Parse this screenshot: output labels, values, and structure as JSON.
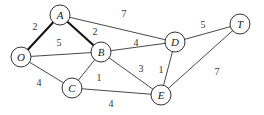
{
  "nodes": [
    {
      "id": "A",
      "label": "A",
      "x": 60,
      "y": 15
    },
    {
      "id": "O",
      "label": "O",
      "x": 21,
      "y": 57
    },
    {
      "id": "B",
      "label": "B",
      "x": 101,
      "y": 52
    },
    {
      "id": "C",
      "label": "C",
      "x": 72,
      "y": 88
    },
    {
      "id": "D",
      "label": "D",
      "x": 175,
      "y": 42
    },
    {
      "id": "T",
      "label": "T",
      "x": 240,
      "y": 24
    },
    {
      "id": "E",
      "label": "E",
      "x": 161,
      "y": 95
    }
  ],
  "edges": [
    {
      "from": "O",
      "to": "A",
      "weight": "2",
      "bold": true,
      "lx": 35,
      "ly": 26
    },
    {
      "from": "A",
      "to": "B",
      "weight": "2",
      "bold": true,
      "lx": 95,
      "ly": 31
    },
    {
      "from": "A",
      "to": "D",
      "weight": "7",
      "bold": false,
      "lx": 124,
      "ly": 13
    },
    {
      "from": "O",
      "to": "B",
      "weight": "5",
      "bold": false,
      "lx": 59,
      "ly": 42
    },
    {
      "from": "O",
      "to": "C",
      "weight": "4",
      "bold": false,
      "lx": 39,
      "ly": 82
    },
    {
      "from": "B",
      "to": "C",
      "weight": "1",
      "bold": false,
      "lx": 99,
      "ly": 77
    },
    {
      "from": "B",
      "to": "D",
      "weight": "4",
      "bold": false,
      "lx": 136,
      "ly": 42
    },
    {
      "from": "B",
      "to": "E",
      "weight": "3",
      "bold": false,
      "lx": 141,
      "ly": 68
    },
    {
      "from": "C",
      "to": "E",
      "weight": "4",
      "bold": false,
      "lx": 111,
      "ly": 103
    },
    {
      "from": "D",
      "to": "E",
      "weight": "1",
      "bold": false,
      "lx": 161,
      "ly": 69
    },
    {
      "from": "D",
      "to": "T",
      "weight": "5",
      "bold": false,
      "lx": 203,
      "ly": 24
    },
    {
      "from": "E",
      "to": "T",
      "weight": "7",
      "bold": false,
      "lx": 217,
      "ly": 71
    }
  ]
}
